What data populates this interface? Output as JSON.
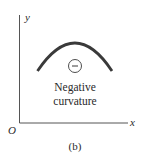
{
  "figure": {
    "caption": "(b)",
    "axes": {
      "x_label": "x",
      "y_label": "y",
      "origin_label": "O"
    },
    "curve": {
      "shape": "concave-down arc",
      "sign_symbol": "−",
      "label_line1": "Negative",
      "label_line2": "curvature"
    },
    "colors": {
      "axis": "#555555",
      "curve": "#3a3a3a",
      "text": "#2a2a2a",
      "background": "#ffffff"
    }
  }
}
